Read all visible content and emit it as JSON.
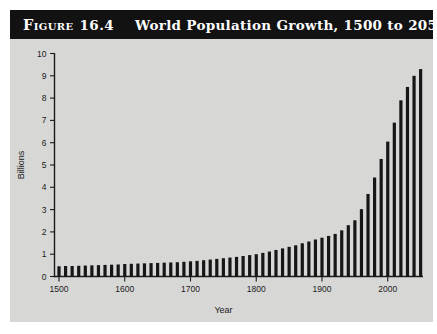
{
  "figure": {
    "label_word": "Figure",
    "label_number": "16.4",
    "title": "World Population Growth, 1500 to 2050"
  },
  "chart_data": {
    "type": "bar",
    "title": "World Population Growth, 1500 to 2050",
    "xlabel": "Year",
    "ylabel": "Billions",
    "ylim": [
      0,
      10
    ],
    "yticks": [
      0,
      1,
      2,
      3,
      4,
      5,
      6,
      7,
      8,
      9,
      10
    ],
    "xticks": [
      1500,
      1600,
      1700,
      1800,
      1900,
      2000
    ],
    "x": [
      1500,
      1510,
      1520,
      1530,
      1540,
      1550,
      1560,
      1570,
      1580,
      1590,
      1600,
      1610,
      1620,
      1630,
      1640,
      1650,
      1660,
      1670,
      1680,
      1690,
      1700,
      1710,
      1720,
      1730,
      1740,
      1750,
      1760,
      1770,
      1780,
      1790,
      1800,
      1810,
      1820,
      1830,
      1840,
      1850,
      1860,
      1870,
      1880,
      1890,
      1900,
      1910,
      1920,
      1930,
      1940,
      1950,
      1960,
      1970,
      1980,
      1990,
      2000,
      2010,
      2020,
      2030,
      2040,
      2050
    ],
    "values": [
      0.46,
      0.47,
      0.47,
      0.48,
      0.49,
      0.5,
      0.51,
      0.52,
      0.53,
      0.54,
      0.56,
      0.57,
      0.58,
      0.59,
      0.6,
      0.61,
      0.62,
      0.63,
      0.64,
      0.66,
      0.68,
      0.7,
      0.73,
      0.76,
      0.79,
      0.82,
      0.85,
      0.88,
      0.92,
      0.96,
      1.0,
      1.06,
      1.12,
      1.19,
      1.26,
      1.33,
      1.4,
      1.49,
      1.57,
      1.66,
      1.74,
      1.82,
      1.91,
      2.07,
      2.3,
      2.52,
      3.02,
      3.7,
      4.44,
      5.27,
      6.05,
      6.9,
      7.9,
      8.5,
      9.0,
      9.3
    ],
    "grid": false,
    "legend": "none",
    "bar_color": "#161616",
    "axis_color": "#1b1b1b",
    "plot_bg": "#d7d7d6",
    "header_bg": "#121212",
    "header_text_color": "#ffffff"
  }
}
